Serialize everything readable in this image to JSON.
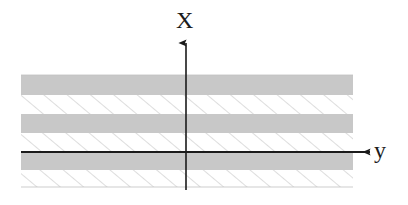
{
  "figure": {
    "background_color": "#ffffff",
    "width": 408,
    "height": 205
  },
  "axes": {
    "vertical": {
      "name": "x-axis",
      "label": "X",
      "label_x": 186,
      "label_y": 22,
      "line_x": 186,
      "line_top_y": 43,
      "line_bottom_y": 190,
      "arrow_at": "top",
      "color": "#1b1b1b",
      "width": 1.6
    },
    "horizontal": {
      "name": "y-axis",
      "label": "y",
      "label_x": 380,
      "label_y": 152,
      "line_y": 152,
      "line_left_x": 21,
      "line_right_x": 370,
      "arrow_at": "right",
      "color": "#1b1b1b",
      "width": 1.8
    },
    "origin": {
      "x": 186,
      "y": 152
    }
  },
  "stack": {
    "name": "layered-medium",
    "left_x": 21,
    "right_x": 353,
    "top_y": 75,
    "bottom_y": 187,
    "solid_color": "#c8c8c8",
    "hatch_color": "#b4b4b4",
    "hatch_bg_color": "#ffffff",
    "hatch_spacing": 15,
    "hatch_angle_deg": 50,
    "hatch_stroke_width": 0.9,
    "edge_color": "#c0c0c0",
    "layers": [
      {
        "index": 0,
        "fill": "solid",
        "top": 75,
        "bottom": 95
      },
      {
        "index": 1,
        "fill": "hatch",
        "top": 95,
        "bottom": 114
      },
      {
        "index": 2,
        "fill": "solid",
        "top": 114,
        "bottom": 133
      },
      {
        "index": 3,
        "fill": "hatch",
        "top": 133,
        "bottom": 153
      },
      {
        "index": 4,
        "fill": "solid",
        "top": 153,
        "bottom": 170
      },
      {
        "index": 5,
        "fill": "hatch",
        "top": 170,
        "bottom": 187
      }
    ]
  }
}
